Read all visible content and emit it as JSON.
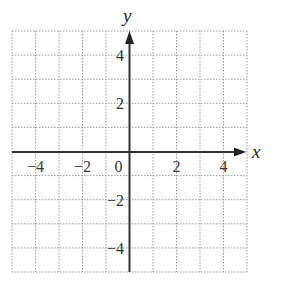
{
  "diagram": {
    "type": "coordinate-grid",
    "x_axis_label": "x",
    "y_axis_label": "y",
    "x_range": [
      -5,
      5
    ],
    "y_range": [
      -5,
      5
    ],
    "grid_step": 1,
    "grid_style": "dotted",
    "x_tick_labels": [
      {
        "value": -4,
        "text": "−4"
      },
      {
        "value": -2,
        "text": "−2"
      },
      {
        "value": 0,
        "text": "0"
      },
      {
        "value": 2,
        "text": "2"
      },
      {
        "value": 4,
        "text": "4"
      }
    ],
    "y_tick_labels": [
      {
        "value": 4,
        "text": "4"
      },
      {
        "value": 2,
        "text": "2"
      },
      {
        "value": -2,
        "text": "−2"
      },
      {
        "value": -4,
        "text": "−4"
      }
    ],
    "colors": {
      "grid": "#9a9a9a",
      "axis": "#333333",
      "text": "#333333"
    }
  }
}
